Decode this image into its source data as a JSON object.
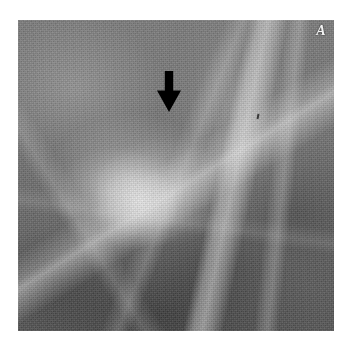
{
  "figure": {
    "type": "mammogram-radiograph",
    "modality": "Mammography",
    "panel_label": "A",
    "canvas": {
      "width": 348,
      "height": 346,
      "background": "#ffffff"
    },
    "image_region": {
      "x": 18,
      "y": 20,
      "width": 316,
      "height": 311
    },
    "tone": {
      "background_gray": "#6e6e6e",
      "parenchyma_mid": "#767676",
      "parenchyma_dark": "#565656",
      "lesion_bright": "#f0f0f0",
      "annotation_black": "#000000",
      "label_white": "#f2f2f2"
    }
  },
  "annotations": {
    "arrow": {
      "name": "pointer-arrow",
      "direction": "down",
      "color": "#000000",
      "tip": {
        "x": 168,
        "y": 110
      },
      "tail": {
        "x": 168,
        "y": 71
      },
      "shaft_width": 9,
      "head_width": 24,
      "head_height": 22
    },
    "panel_label": {
      "text": "A",
      "color": "#f2f2f2",
      "style": "bold-italic-serif",
      "position": "top-right"
    }
  },
  "image_features": [
    {
      "name": "spiculated-mass",
      "description": "Bright irregular focal density with radiating spicules, centre-left of field",
      "center": {
        "x": 140,
        "y": 170
      }
    },
    {
      "name": "bright-vertical-band",
      "description": "Dense fibroglandular band running obliquely in the upper-right quadrant",
      "center": {
        "x": 245,
        "y": 80
      }
    },
    {
      "name": "diagonal-spicule",
      "description": "Linear bright structure extending from the lower-left toward the mass",
      "center": {
        "x": 80,
        "y": 240
      }
    },
    {
      "name": "dark-fatty-region",
      "description": "Darker mottled fatty tissue occupying the lower third of the field",
      "center": {
        "x": 175,
        "y": 295
      }
    },
    {
      "name": "speck-artifact",
      "description": "Small dark punctate artifact right of centre",
      "center": {
        "x": 257,
        "y": 114
      }
    }
  ]
}
